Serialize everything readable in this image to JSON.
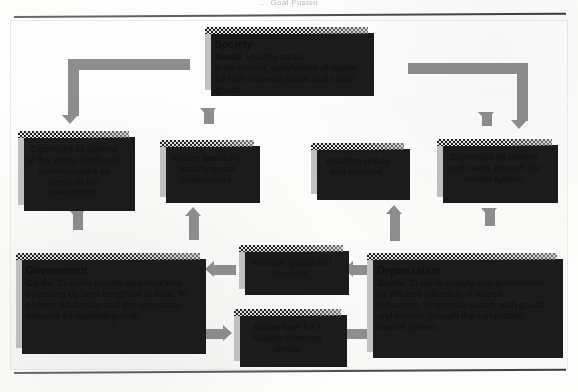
{
  "page": {
    "running_head": "... Goal Fusion",
    "figure_title": ""
  },
  "nodes": {
    "society": {
      "title": "Society",
      "goals_label": "Goals",
      "goals_text": ": Healthy social environment, satisfaction of needs for both material goods and social goods."
    },
    "voting": {
      "text": "Expresses its desires at the voting booth and communicates its needs to the government."
    },
    "laws_social": {
      "text": "Makes laws for a healthy social environment."
    },
    "provides_top": {
      "text": "Provides goods and services."
    },
    "market_system": {
      "text": "Expresses its desires and needs through the market system."
    },
    "government": {
      "title": "Government",
      "goals_label": "Goals",
      "goals_text": ": To serve society and business by setting up laws beneficial to both. To provide leadership and the necessary stimulus for national growth."
    },
    "provides_mid": {
      "text": "Provides goods and services."
    },
    "laws_business": {
      "text": "Makes laws for a healthy business climate."
    },
    "organization": {
      "title": "Organization",
      "goals_label": "Goals",
      "goals_text": ": To serve society and government by efficient utilization of scarce resources. To provide society with goods and service through the competitive market system."
    }
  },
  "connectors": [
    {
      "name": "society-to-voting-branch",
      "direction": "down",
      "from": "society",
      "to": "voting"
    },
    {
      "name": "society-to-laws-social",
      "direction": "down",
      "from": "society",
      "to": "laws_social"
    },
    {
      "name": "society-to-provides-top",
      "direction": "down",
      "from": "society",
      "to": "provides_top"
    },
    {
      "name": "society-to-market-branch",
      "direction": "down",
      "from": "society",
      "to": "market_system"
    },
    {
      "name": "voting-to-government",
      "direction": "down",
      "from": "voting",
      "to": "government"
    },
    {
      "name": "government-to-laws-social",
      "direction": "up",
      "from": "government",
      "to": "laws_social"
    },
    {
      "name": "organization-to-provides-top",
      "direction": "up",
      "from": "organization",
      "to": "provides_top"
    },
    {
      "name": "market-to-organization",
      "direction": "down",
      "from": "market_system",
      "to": "organization"
    },
    {
      "name": "provides-mid-to-government",
      "direction": "left",
      "from": "provides_mid",
      "to": "government"
    },
    {
      "name": "organization-to-provides-mid",
      "direction": "left",
      "from": "organization",
      "to": "provides_mid"
    },
    {
      "name": "government-to-laws-business",
      "direction": "right",
      "from": "government",
      "to": "laws_business"
    },
    {
      "name": "laws-business-to-organization",
      "direction": "right",
      "from": "laws_business",
      "to": "organization"
    }
  ],
  "colors": {
    "box_fill": "#c2c2c2",
    "box_shadow": "#1b1b1b",
    "connector": "#8e8e8e",
    "text": "#101010",
    "page_background": "#fdfdfc",
    "rule": "#4a4a4a"
  }
}
